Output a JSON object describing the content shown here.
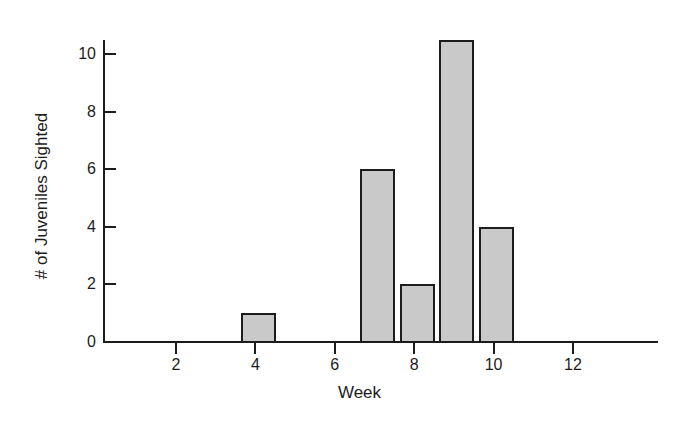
{
  "chart_data": {
    "type": "bar",
    "title": "",
    "subtitle": "",
    "xlabel": "Week",
    "ylabel": "# of Juveniles Sighted",
    "x": [
      1,
      2,
      3,
      4,
      5,
      6,
      7,
      8,
      9,
      10,
      11,
      12,
      13
    ],
    "categories": [
      "1",
      "2",
      "3",
      "4",
      "5",
      "6",
      "7",
      "8",
      "9",
      "10",
      "11",
      "12",
      "13"
    ],
    "values": [
      0,
      0,
      0,
      1,
      0,
      0,
      6,
      2,
      10.5,
      4,
      0,
      0,
      0
    ],
    "bars": [
      {
        "week": 4,
        "value": 1
      },
      {
        "week": 7,
        "value": 6
      },
      {
        "week": 8,
        "value": 2
      },
      {
        "week": 9,
        "value": 10.5
      },
      {
        "week": 10,
        "value": 4
      }
    ],
    "xlim": [
      0.8,
      14.8
    ],
    "ylim": [
      0,
      10.5
    ],
    "xticks": [
      2,
      4,
      6,
      8,
      10,
      12
    ],
    "xticklabels": [
      "2",
      "4",
      "6",
      "8",
      "10",
      "12"
    ],
    "yticks": [
      0,
      2,
      4,
      6,
      8,
      10
    ],
    "yticklabels": [
      "0",
      "2",
      "4",
      "6",
      "8",
      "10"
    ],
    "grid": false,
    "legend": null,
    "bar_fill_color": "#c9c9c9",
    "bar_edge_color": "#1c1c1c",
    "axis_color": "#1c1c1c",
    "background_color": "#ffffff",
    "bar_width_weeks": 0.88
  },
  "figure": {
    "x_axis_title": "Week",
    "y_axis_title": "# of Juveniles Sighted"
  }
}
